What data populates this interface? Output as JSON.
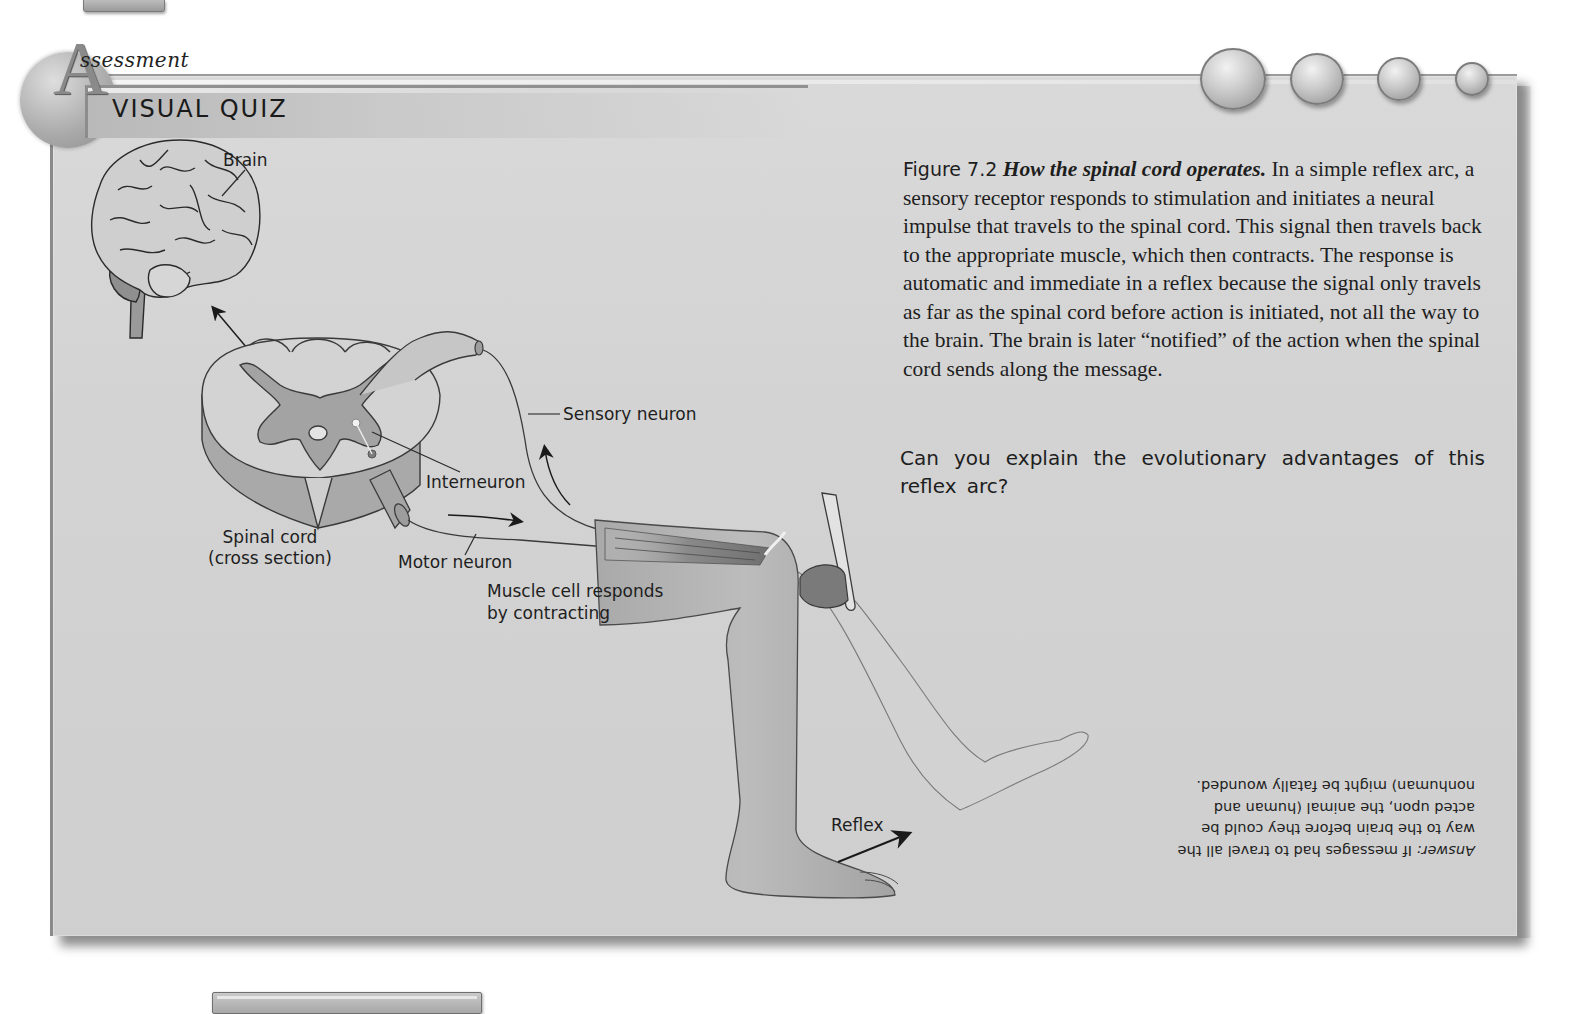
{
  "header": {
    "section_initial": "A",
    "section_label": "ssessment",
    "section_full": "Assessment",
    "title": "VISUAL QUIZ"
  },
  "decorations": {
    "bubbles": 4,
    "icons": [
      "top-page-tab",
      "bottom-page-tab",
      "assessment-badge-circle",
      "bubble-circles"
    ]
  },
  "caption": {
    "figure_number": "Figure 7.2",
    "figure_title": "How the spinal cord operates.",
    "body": "In a simple reflex arc, a sensory receptor responds to stimulation and initiates a neural impulse that travels to the spinal cord. This signal then travels back to the appropriate muscle, which then contracts. The response is automatic and immediate in a reflex because the signal only travels as far as the spinal cord before action is initiated, not all the way to the brain. The brain is later “notified” of the action when the spinal cord sends along the message."
  },
  "question": "Can you explain the evolutionary advantages of this reflex arc?",
  "answer": {
    "label": "Answer:",
    "text": "If messages had to travel all the way to the brain before they could be acted upon, the animal (human and nonhuman) might be fatally wounded.",
    "orientation": "upside-down"
  },
  "diagram": {
    "labels": {
      "brain": "Brain",
      "sensory_neuron": "Sensory neuron",
      "interneuron": "Interneuron",
      "spinal_cord": "Spinal cord",
      "spinal_cord_sub": "(cross section)",
      "motor_neuron": "Motor neuron",
      "muscle_line1": "Muscle cell responds",
      "muscle_line2": "by contracting",
      "reflex": "Reflex"
    }
  },
  "colors": {
    "panel_bg": "#d6d6d6",
    "panel_border": "#8a8a8a",
    "text": "#1e1e1e",
    "grey_matter": "#a9a9a9",
    "leg_fill": "#b5b5b5",
    "ghost_leg_fill": "#d2d2d2"
  }
}
